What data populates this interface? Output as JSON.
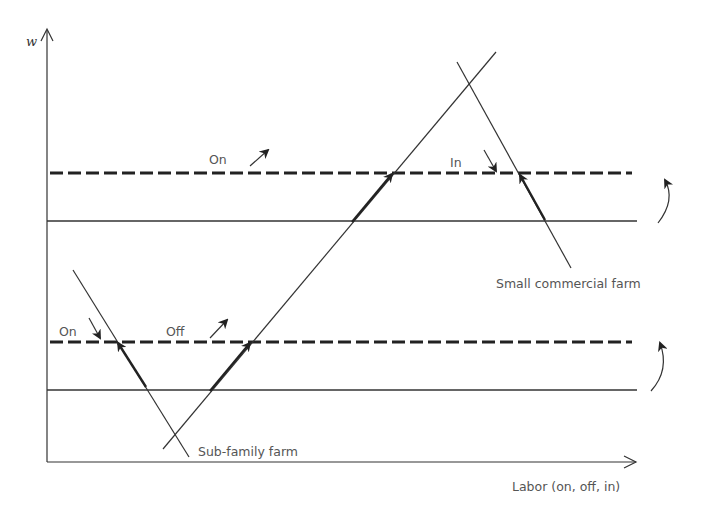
{
  "diagram": {
    "type": "labor-allocation-diagram",
    "y_axis_label": "w",
    "x_axis_label": "Labor (on, off, in)",
    "curves": [
      {
        "name": "Sub-family farm",
        "label": "Sub-family farm",
        "direction": "descending"
      },
      {
        "name": "Small commercial farm",
        "label": "Small commercial farm",
        "direction": "descending"
      },
      {
        "name": "rising labor line",
        "label": "",
        "direction": "ascending"
      }
    ],
    "wage_levels": [
      {
        "name": "upper-initial",
        "style": "solid"
      },
      {
        "name": "upper-shifted",
        "style": "dashed"
      },
      {
        "name": "lower-initial",
        "style": "solid"
      },
      {
        "name": "lower-shifted",
        "style": "dashed"
      }
    ],
    "annotations": {
      "upper_on": "On",
      "upper_in": "In",
      "lower_on": "On",
      "lower_off": "Off"
    },
    "colors": {
      "line": "#333333",
      "dash": "#222222",
      "text": "#555555",
      "background": "#ffffff"
    }
  }
}
